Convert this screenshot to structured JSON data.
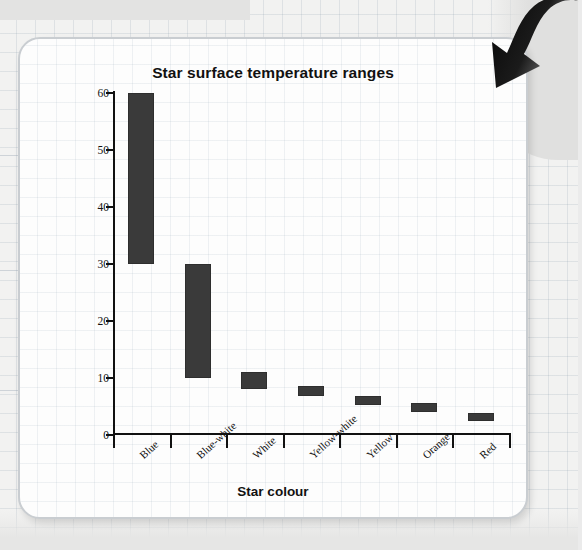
{
  "chart_data": {
    "type": "bar",
    "variant": "floating-range-bar",
    "title": "Star surface temperature ranges",
    "xlabel": "Star colour",
    "ylabel": "Temperature (in thousands of kelvins)",
    "categories": [
      "Blue",
      "Blue-white",
      "White",
      "Yellow-white",
      "Yellow",
      "Orange",
      "Red"
    ],
    "ranges": [
      {
        "category": "Blue",
        "low": 30,
        "high": 60
      },
      {
        "category": "Blue-white",
        "low": 10,
        "high": 30
      },
      {
        "category": "White",
        "low": 8,
        "high": 11
      },
      {
        "category": "Yellow-white",
        "low": 6.8,
        "high": 8.6
      },
      {
        "category": "Yellow",
        "low": 5.2,
        "high": 6.8
      },
      {
        "category": "Orange",
        "low": 4.0,
        "high": 5.6
      },
      {
        "category": "Red",
        "low": 2.4,
        "high": 3.8
      }
    ],
    "ylim": [
      0,
      60
    ],
    "yticks": [
      0,
      10,
      20,
      30,
      40,
      50,
      60
    ],
    "ytick_labels": [
      "0",
      "10",
      "20",
      "30",
      "40",
      "50",
      "60"
    ],
    "grid": true,
    "legend": false,
    "bar_color": "#3a3a3a",
    "axis_color": "#111111",
    "units": "thousands of kelvins"
  },
  "page": {
    "card_border_color": "#c9cdd1",
    "card_background": "#fdfdfd",
    "backdrop_color": "#f2f2f1"
  },
  "annotations": {
    "arrow_icon_name": "curved-down-arrow-icon",
    "arrow_color": "#111111"
  }
}
